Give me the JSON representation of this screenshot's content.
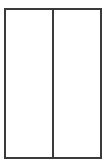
{
  "canvas": {
    "width": 106,
    "height": 165,
    "background_color": "#ffffff"
  },
  "diagram": {
    "type": "two-pane-frame",
    "frame": {
      "x": 4,
      "y": 8,
      "width": 98,
      "height": 151,
      "border_color": "#3a3a3a",
      "border_width": 2,
      "fill_color": "#ffffff"
    },
    "divider": {
      "orientation": "vertical",
      "x": 52,
      "color": "#3a3a3a",
      "width": 2
    },
    "panes": [
      {
        "name": "left-pane",
        "width": 46,
        "fill_color": "#ffffff",
        "content": ""
      },
      {
        "name": "right-pane",
        "width": 46,
        "fill_color": "#ffffff",
        "content": ""
      }
    ]
  }
}
